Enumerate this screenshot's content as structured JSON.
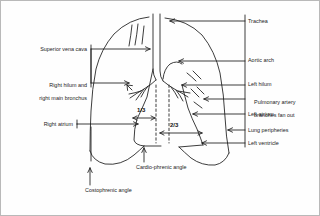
{
  "figure": {
    "type": "anatomical-line-diagram",
    "stroke_color": "#1a1a1a",
    "background_color": "#fefefe",
    "border_color": "#b9b9b9"
  },
  "labels_left": [
    {
      "id": "superior-vena-cava",
      "text": "Superior vena cava",
      "lines": [
        "Superior vena cava"
      ],
      "x": 18,
      "y": 45,
      "align": "right",
      "anchor_x": 123,
      "anchor_y": 48
    },
    {
      "id": "right-hilum-and-right-main-bronchus",
      "text": "Right hilum and right main bronchus",
      "lines": [
        "Right hilum and",
        "right main bronchus"
      ],
      "x": 16,
      "y": 75,
      "align": "right",
      "anchor_x": 130,
      "anchor_y": 82
    },
    {
      "id": "right-atrium",
      "text": "Right atrium",
      "lines": [
        "Right atrium"
      ],
      "x": 41,
      "y": 120,
      "align": "right",
      "anchor_x": 132,
      "anchor_y": 123
    }
  ],
  "labels_right": [
    {
      "id": "trachea",
      "text": "Trachea",
      "lines": [
        "Trachea"
      ],
      "x": 247,
      "y": 17,
      "align": "left",
      "anchor_x": 171,
      "anchor_y": 20
    },
    {
      "id": "aortic-arch",
      "text": "Aortic arch",
      "lines": [
        "Aortic arch"
      ],
      "x": 247,
      "y": 55,
      "align": "left",
      "anchor_x": 177,
      "anchor_y": 60
    },
    {
      "id": "left-hilum",
      "text": "Left hilum",
      "lines": [
        "Left hilum"
      ],
      "x": 247,
      "y": 79,
      "align": "left",
      "anchor_x": 180,
      "anchor_y": 84
    },
    {
      "id": "pulmonary-artery-branches-fan-out",
      "text": "Pulmonary artery branches fan out",
      "lines": [
        "Pulmonary artery",
        "branches fan out"
      ],
      "x": 247,
      "y": 92,
      "align": "left",
      "anchor_x": 202,
      "anchor_y": 98
    },
    {
      "id": "left-atrium",
      "text": "Left atrium",
      "lines": [
        "Left atrium"
      ],
      "x": 247,
      "y": 110,
      "align": "left",
      "anchor_x": 194,
      "anchor_y": 113
    },
    {
      "id": "lung-peripheries",
      "text": "Lung peripheries",
      "lines": [
        "Lung peripheries"
      ],
      "x": 247,
      "y": 126,
      "align": "left",
      "anchor_x": 226,
      "anchor_y": 129
    },
    {
      "id": "left-ventricle",
      "text": "Left ventricle",
      "lines": [
        "Left ventricle"
      ],
      "x": 247,
      "y": 139,
      "align": "left",
      "anchor_x": 203,
      "anchor_y": 142
    }
  ],
  "labels_bottom": [
    {
      "id": "cardio-phrenic-angle",
      "text": "Cardio-phrenic angle",
      "lines": [
        "Cardio-phrenic angle"
      ],
      "x": 135,
      "y": 165,
      "align": "left",
      "anchor_x": 143,
      "anchor_y": 146
    },
    {
      "id": "costophrenic-angle",
      "text": "Costophrenic angle",
      "lines": [
        "Costophrenic angle"
      ],
      "x": 84,
      "y": 188,
      "align": "left",
      "anchor_x": 89,
      "anchor_y": 166
    }
  ],
  "measurements": [
    {
      "id": "one-third",
      "text": "1/3",
      "x": 139,
      "y": 111,
      "span_from_x": 131,
      "span_to_x": 155,
      "span_y": 117
    },
    {
      "id": "two-thirds",
      "text": "2/3",
      "x": 172,
      "y": 125,
      "span_from_x": 158,
      "span_to_x": 202,
      "span_y": 132
    }
  ],
  "structures": [
    "right lung outline",
    "left lung outline",
    "trachea",
    "carina",
    "right main bronchus",
    "left main bronchus",
    "pulmonary artery branches",
    "cardiac silhouette",
    "right hemidiaphragm",
    "left hemidiaphragm",
    "aortic arch knuckle"
  ]
}
